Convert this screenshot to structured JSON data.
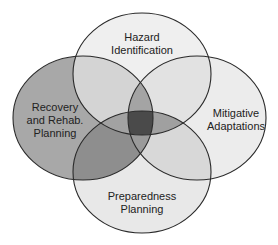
{
  "diagram": {
    "type": "venn",
    "sets": [
      {
        "id": "hazard",
        "label": "Hazard\nIdentification",
        "fill": "#efefef"
      },
      {
        "id": "recovery",
        "label": "Recovery\nand Rehab.\nPlanning",
        "fill": "#a6a6a6"
      },
      {
        "id": "mitigative",
        "label": "Mitigative\nAdaptations",
        "fill": "#ececec"
      },
      {
        "id": "preparedness",
        "label": "Preparedness\nPlanning",
        "fill": "#e6e6e6"
      }
    ],
    "center_fill": "#4a4a4a",
    "stroke": "#2a2a2a"
  }
}
